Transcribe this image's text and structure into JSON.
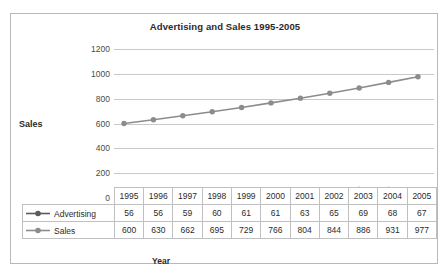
{
  "chart_data": {
    "type": "line",
    "title": "Advertising and Sales 1995-2005",
    "xlabel": "Year",
    "ylabel": "Sales",
    "categories": [
      "1995",
      "1996",
      "1997",
      "1998",
      "1999",
      "2000",
      "2001",
      "2002",
      "2003",
      "2004",
      "2005"
    ],
    "yticks": [
      "1200",
      "1000",
      "800",
      "600",
      "400",
      "200",
      "0"
    ],
    "ylim": [
      0,
      1200
    ],
    "grid": true,
    "legend_position": "table-left",
    "series": [
      {
        "name": "Advertising",
        "color": "#5a5a5a",
        "values": [
          56,
          56,
          59,
          60,
          61,
          61,
          63,
          65,
          69,
          68,
          67
        ]
      },
      {
        "name": "Sales",
        "color": "#8c8c8c",
        "values": [
          600,
          630,
          662,
          695,
          729,
          766,
          804,
          844,
          886,
          931,
          977
        ]
      }
    ]
  },
  "table": {
    "corner_label": "",
    "header_row": [
      "1995",
      "1996",
      "1997",
      "1998",
      "1999",
      "2000",
      "2001",
      "2002",
      "2003",
      "2004",
      "2005"
    ],
    "rows": [
      {
        "label": "Advertising",
        "values": [
          "56",
          "56",
          "59",
          "60",
          "61",
          "61",
          "63",
          "65",
          "69",
          "68",
          "67"
        ]
      },
      {
        "label": "Sales",
        "values": [
          "600",
          "630",
          "662",
          "695",
          "729",
          "766",
          "804",
          "844",
          "886",
          "931",
          "977"
        ]
      }
    ]
  },
  "colors": {
    "advertising": "#5a5a5a",
    "sales": "#8c8c8c",
    "gridline": "#c9c9c9",
    "border": "#b8b8b8",
    "text": "#2b2b2b"
  }
}
